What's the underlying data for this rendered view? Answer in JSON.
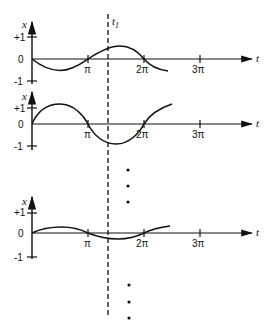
{
  "figure": {
    "time_axis_label": "t",
    "value_axis_label": "x",
    "marker_label": "t",
    "marker_subscript": "1",
    "ylabels": {
      "plus_one": "+1",
      "zero": "0",
      "minus_one": "-1"
    },
    "xticks": [
      "π",
      "2π",
      "3π"
    ],
    "line_color": "#111111",
    "panels": [
      {
        "name": "panel-1",
        "description": "x(t) = -0.6 sin(t) starting at 0, ends near t≈2.3π"
      },
      {
        "name": "panel-2",
        "description": "x(t) = 1.2 sin(t), ends near t≈2.3π"
      },
      {
        "name": "panel-3",
        "description": "x(t) = 0.3 sin(t), ends near t≈2.3π"
      }
    ],
    "ellipsis_dots": 3
  }
}
